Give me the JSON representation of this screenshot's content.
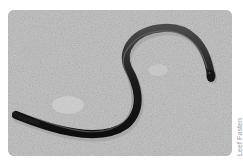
{
  "photo": {
    "subject": "S-shaped legless reptile on stone surface",
    "style": "grayscale",
    "background_color": "#c4c4c4",
    "creature_color": "#1e1e1e"
  },
  "credit": {
    "text": "Leef Fasten"
  }
}
